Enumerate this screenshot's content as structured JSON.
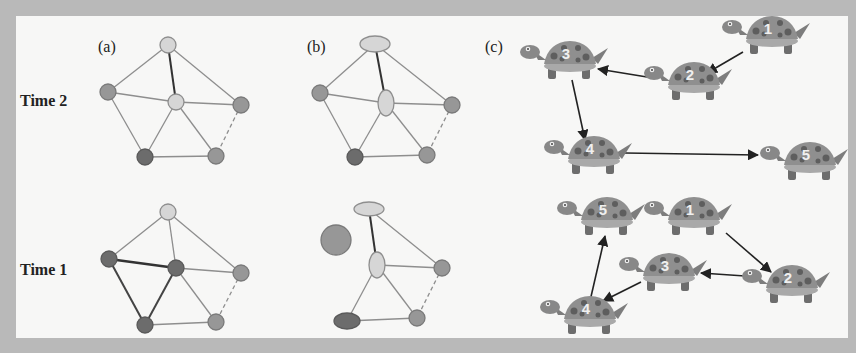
{
  "labels": {
    "panel_a": "(a)",
    "panel_b": "(b)",
    "panel_c": "(c)",
    "time2": "Time 2",
    "time1": "Time 1"
  },
  "colors": {
    "frame": "#b9b9b9",
    "background": "#f7f7f6",
    "node_light": "#d6d6d6",
    "node_mid": "#979797",
    "node_dark": "#6c6c6c",
    "edge": "#8e8e8e",
    "edge_strong": "#333333",
    "turtle_shell": "#8f8f8f",
    "turtle_spots": "#5e5e5e",
    "turtle_body": "#7d7d7d"
  },
  "turtles": {
    "top": [
      {
        "id": "1",
        "label": "1"
      },
      {
        "id": "2",
        "label": "2"
      },
      {
        "id": "3",
        "label": "3"
      },
      {
        "id": "4",
        "label": "4"
      },
      {
        "id": "5",
        "label": "5"
      }
    ],
    "bottom": [
      {
        "id": "5",
        "label": "5"
      },
      {
        "id": "1",
        "label": "1"
      },
      {
        "id": "3",
        "label": "3"
      },
      {
        "id": "2",
        "label": "2"
      },
      {
        "id": "4",
        "label": "4"
      }
    ],
    "top_edges": [
      "1→2",
      "2→3",
      "3→4",
      "4→5"
    ],
    "bottom_edges": [
      "1→2",
      "2→3",
      "3→4",
      "4→5"
    ]
  }
}
